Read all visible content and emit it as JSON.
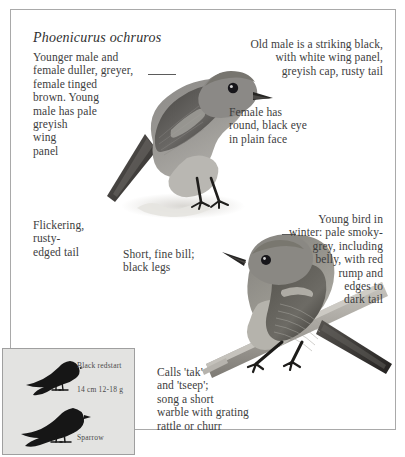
{
  "page": {
    "species_name": "Phoenicurus ochruros"
  },
  "callouts": {
    "younger_male": "Younger male and\nfemale duller, greyer,\nfemale tinged\nbrown. Young\nmale has pale\ngreyish\nwing\npanel",
    "old_male": "Old male is a striking black,\nwith white wing panel,\ngreyish cap, rusty tail",
    "female_eye": "Female has\nround, black eye\nin plain face",
    "flickering_tail": "Flickering,\nrusty-\nedged tail",
    "bill_legs": "Short, fine bill;\nblack legs",
    "young_winter": "Young bird in\nwinter: pale smoky-\ngrey, including\nbelly, with red\nrump and\nedges to\ndark tail",
    "calls": "Calls 'tak'\nand 'tseep';\nsong a short\nwarble with grating\nrattle or churr"
  },
  "illustrations": {
    "upper_bird": "black-redstart-perched-standing",
    "lower_bird": "black-redstart-juvenile-on-branch"
  },
  "size_inset": {
    "redstart_label": "Black redstart",
    "measurements": "14 cm  12-18 g",
    "sparrow_label": "Sparrow",
    "redstart_silhouette": "black-redstart-silhouette",
    "sparrow_silhouette": "sparrow-silhouette",
    "background_color": "#e3e3e1"
  },
  "colors": {
    "frame_border": "#a9a9a9",
    "text": "#3d3d3d",
    "inset_background": "#e3e3e1",
    "silhouette": "#161616"
  }
}
